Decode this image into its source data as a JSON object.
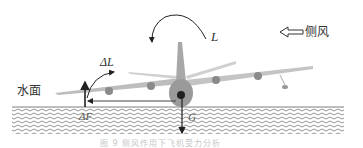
{
  "diagram": {
    "water_label": "水面",
    "crosswind_label": "侧风",
    "delta_lift_label": "ΔL",
    "lift_label": "L",
    "delta_force_label": "ΔF",
    "gravity_label": "G",
    "caption": "图 9   侧风作用下飞机受力分析"
  },
  "colors": {
    "water_hatch": "#777777",
    "arrow": "#222222",
    "aircraft": "#9a9a9a"
  }
}
